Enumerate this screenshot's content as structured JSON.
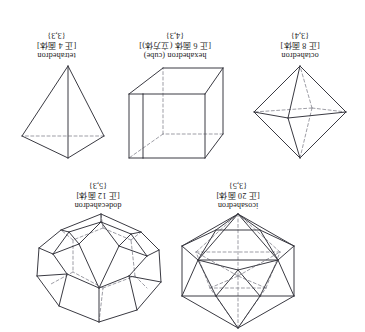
{
  "page": {
    "orientation": "upside-down",
    "background_color": "#ffffff",
    "edge_color": "#3a3a42",
    "hidden_edge_color": "#8d8d96"
  },
  "solids": [
    {
      "key": "icosahedron",
      "name": "icosahedron",
      "jp": "[正 20 面体]",
      "schlafli": "{3,5}"
    },
    {
      "key": "dodecahedron",
      "name": "dodecahedron",
      "jp": "[正 12 面体]",
      "schlafli": "{5,3}"
    },
    {
      "key": "octahedron",
      "name": "octahedron",
      "jp": "[正 8 面体]",
      "schlafli": "{3,4}"
    },
    {
      "key": "hexahedron",
      "name": "hexahedron (cube)",
      "jp": "[正 6 面体 (立方体)]",
      "schlafli": "{4,3}"
    },
    {
      "key": "tetrahedron",
      "name": "tetrahedron",
      "jp": "[正 4 面体]",
      "schlafli": "{3,3}"
    }
  ]
}
